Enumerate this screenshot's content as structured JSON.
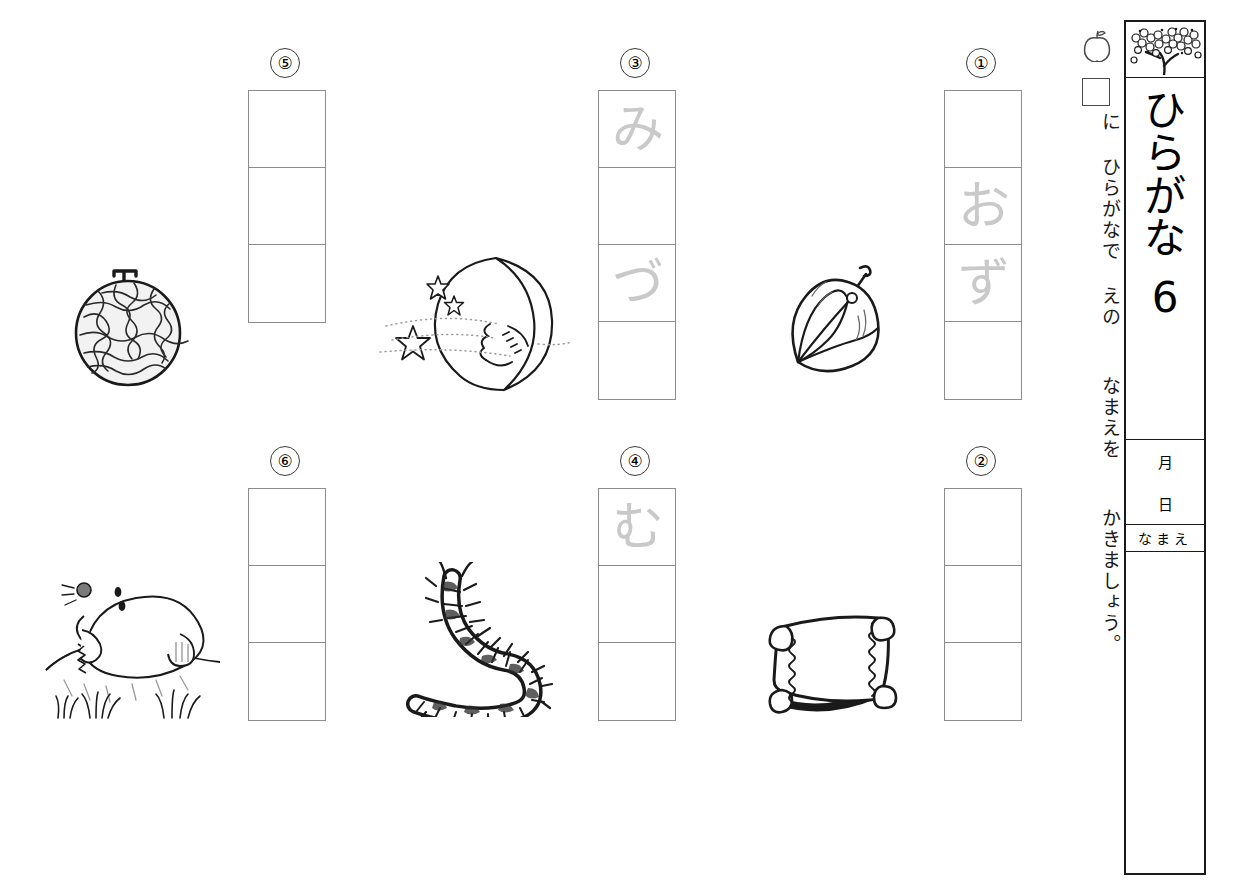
{
  "document": {
    "type": "hiragana-worksheet",
    "title_chars": [
      "ひ",
      "ら",
      "が",
      "な"
    ],
    "title_text": "ひらがな",
    "title_number": "6",
    "header_art": "cherry-blossom-branch",
    "fields": {
      "month_label": "月",
      "day_label": "日",
      "name_label": "なまえ"
    }
  },
  "instruction": {
    "apple_icon": "apple-icon",
    "square_icon": "empty-square-icon",
    "text": "に ひらがなで えの  なまえを  かきましょう。"
  },
  "problems": [
    {
      "number": "①",
      "picture": "ground-cherry",
      "picture_name": "ほおずき",
      "cells": [
        "",
        "お",
        "ず",
        ""
      ],
      "cell_count": 4
    },
    {
      "number": "②",
      "picture": "pillow",
      "picture_name": "まくら",
      "cells": [
        "",
        "",
        ""
      ],
      "cell_count": 3
    },
    {
      "number": "③",
      "picture": "crescent-moon",
      "picture_name": "みかづき",
      "cells": [
        "み",
        "",
        "づ",
        ""
      ],
      "cell_count": 4
    },
    {
      "number": "④",
      "picture": "centipede",
      "picture_name": "むかで",
      "cells": [
        "む",
        "",
        ""
      ],
      "cell_count": 3
    },
    {
      "number": "⑤",
      "picture": "melon",
      "picture_name": "めろん",
      "cells": [
        "",
        "",
        ""
      ],
      "cell_count": 3
    },
    {
      "number": "⑥",
      "picture": "mole",
      "picture_name": "もぐら",
      "cells": [
        "",
        "",
        ""
      ],
      "cell_count": 3
    }
  ],
  "colors": {
    "ink": "#1a1a1a",
    "grid_line": "#8c8c8c",
    "ghost_char": "#c9c9c9",
    "paper": "#ffffff"
  }
}
